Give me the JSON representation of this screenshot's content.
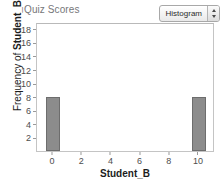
{
  "title": "Quiz Scores",
  "controls": {
    "plot_type": {
      "value": "Histogram",
      "stepper_up_icon": "triangle-up-icon",
      "stepper_down_icon": "triangle-down-icon"
    }
  },
  "chart_data": {
    "type": "bar",
    "title": "Quiz Scores",
    "xlabel": "Student_B",
    "ylabel": "Frequency of Student_B",
    "ylabel_prefix": "Frequency of ",
    "ylabel_variable": "Student_B",
    "categories": [
      0,
      10
    ],
    "values": [
      8,
      8
    ],
    "bars": [
      {
        "center": 0,
        "left": -0.5,
        "right": 0.5,
        "value": 8
      },
      {
        "center": 10,
        "left": 9.5,
        "right": 10.5,
        "value": 8
      }
    ],
    "bin_width": 1,
    "xlim": [
      -1.1,
      11.1
    ],
    "ylim": [
      0,
      19
    ],
    "x_ticks": [
      0,
      2,
      4,
      6,
      8,
      10
    ],
    "y_ticks": [
      2,
      4,
      6,
      8,
      10,
      12,
      14,
      16,
      18
    ],
    "grid": false,
    "legend": false,
    "bar_color": "#8c8c8c",
    "bar_edge_color": "#6d6d6d",
    "frame_color": "#c4c4c4",
    "title_color": "#77777a"
  }
}
